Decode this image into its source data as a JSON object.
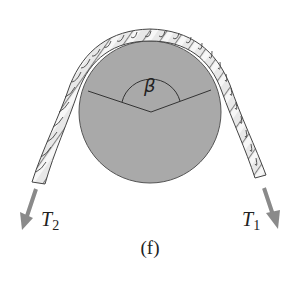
{
  "figure": {
    "caption": "(f)",
    "angle_label": "β",
    "tension_left": {
      "symbol": "T",
      "subscript": "2"
    },
    "tension_right": {
      "symbol": "T",
      "subscript": "1"
    }
  },
  "colors": {
    "background": "#ffffff",
    "pulley_fill": "#a8a8a8",
    "pulley_stroke": "#555555",
    "rope_fill": "#e6e6e6",
    "rope_stroke": "#444444",
    "arrow": "#8a8a8a",
    "line": "#333333"
  }
}
